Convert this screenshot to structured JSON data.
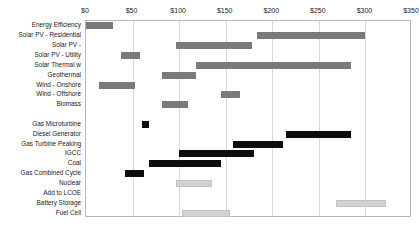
{
  "chart_data": {
    "type": "bar",
    "subtype": "floating-range-bar",
    "title": "",
    "subtitle": "",
    "xlabel": "",
    "ylabel": "",
    "xlim": [
      0,
      350
    ],
    "xunit": "$",
    "axis_position": "top",
    "grid": true,
    "gridlines": [
      0,
      50,
      100,
      150,
      200,
      250,
      300,
      350
    ],
    "legend": "none",
    "tick_labels": [
      "$0",
      "$50",
      "$100",
      "$150",
      "$200",
      "$250",
      "$300",
      "$350"
    ],
    "tick_values": [
      0,
      50,
      100,
      150,
      200,
      250,
      300,
      350
    ],
    "colors": {
      "dark_gray": "#7a7a7a",
      "black": "#0d0d0d",
      "light_gray": "#d2d2d2",
      "grid": "#d9d9d9",
      "frame": "#b8b8b8",
      "text": "#1a1a1a",
      "background": "#ffffff"
    },
    "categories": [
      "Energy Efficiency",
      "Solar PV - Residential",
      "Solar PV -",
      "Solar PV - Utility",
      "Solar Thermal w",
      "Geothermal",
      "Wind - Onshore",
      "Wind - Offshore",
      "Biomass",
      "",
      "Gas Microturbine",
      "Diesel Generator",
      "Gas Turbine Peaking",
      "IGCC",
      "Coal",
      "Gas Combined Cycle",
      "Nuclear",
      "Add to LCOE",
      "Battery Storage",
      "Fuel Cell"
    ],
    "bars": [
      {
        "category": "Energy Efficiency",
        "low": 0,
        "high": 29,
        "color": "dark_gray"
      },
      {
        "category": "Solar PV - Residential",
        "low": 184,
        "high": 300,
        "color": "dark_gray"
      },
      {
        "category": "Solar PV -",
        "low": 97,
        "high": 178,
        "color": "dark_gray"
      },
      {
        "category": "Solar PV - Utility",
        "low": 38,
        "high": 58,
        "color": "dark_gray"
      },
      {
        "category": "Solar Thermal w",
        "low": 118,
        "high": 285,
        "color": "dark_gray"
      },
      {
        "category": "Geothermal",
        "low": 82,
        "high": 118,
        "color": "dark_gray"
      },
      {
        "category": "Wind - Onshore",
        "low": 14,
        "high": 53,
        "color": "dark_gray"
      },
      {
        "category": "Wind - Offshore",
        "low": 145,
        "high": 165,
        "color": "dark_gray"
      },
      {
        "category": "Biomass",
        "low": 82,
        "high": 110,
        "color": "dark_gray"
      },
      {
        "category": "Gas Microturbine",
        "low": 60,
        "high": 68,
        "color": "black"
      },
      {
        "category": "Diesel Generator",
        "low": 215,
        "high": 285,
        "color": "black"
      },
      {
        "category": "Gas Turbine Peaking",
        "low": 158,
        "high": 212,
        "color": "black"
      },
      {
        "category": "IGCC",
        "low": 100,
        "high": 180,
        "color": "black"
      },
      {
        "category": "Coal",
        "low": 68,
        "high": 145,
        "color": "black"
      },
      {
        "category": "Gas Combined Cycle",
        "low": 42,
        "high": 62,
        "color": "black"
      },
      {
        "category": "Nuclear",
        "low": 97,
        "high": 135,
        "color": "light_gray"
      },
      {
        "category": "Battery Storage",
        "low": 268,
        "high": 322,
        "color": "light_gray"
      },
      {
        "category": "Fuel Cell",
        "low": 103,
        "high": 155,
        "color": "light_gray"
      }
    ]
  }
}
